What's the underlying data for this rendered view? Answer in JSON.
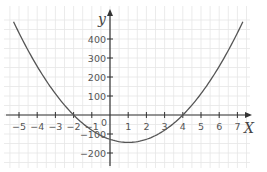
{
  "chart_data": {
    "type": "line",
    "title": "",
    "xlabel": "X",
    "ylabel": "y",
    "xlim": [
      -5.5,
      7.5
    ],
    "ylim": [
      -250,
      500
    ],
    "grid": true,
    "x_ticks": [
      -5,
      -4,
      -3,
      -2,
      -1,
      0,
      1,
      2,
      3,
      4,
      5,
      6,
      7
    ],
    "y_ticks": [
      -200,
      -100,
      100,
      200,
      300,
      400
    ],
    "origin_label": "0",
    "series": [
      {
        "name": "y = 16(x+2)(x-4)",
        "x": [
          -5.3,
          -5,
          -4,
          -3,
          -2,
          -1,
          0,
          1,
          2,
          3,
          4,
          5,
          6,
          7,
          7.3
        ],
        "y": [
          491,
          432,
          256,
          112,
          0,
          -80,
          -128,
          -144,
          -128,
          -80,
          0,
          112,
          256,
          432,
          491
        ]
      }
    ],
    "colors": {
      "curve": "#555555",
      "axis": "#333333",
      "grid": "#e6e6e6"
    }
  }
}
